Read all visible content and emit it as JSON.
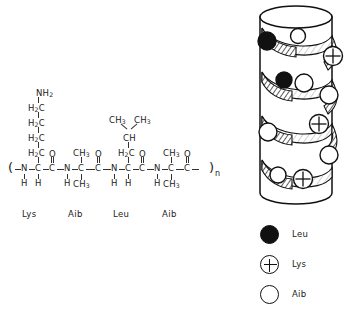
{
  "figure": {
    "title": "",
    "type": "chemical-structure-and-helix-model"
  },
  "structure": {
    "open_paren": "(",
    "close_paren": ")",
    "repeat_subscript": "n",
    "residues": [
      {
        "name": "Lys",
        "label": "Lys",
        "backbone": {
          "n": "N",
          "n_h": "H",
          "ca": "C",
          "ca_h": "H",
          "co": "C",
          "o": "O"
        },
        "sidechain_top_down": [
          "NH2",
          "H2C",
          "H2C",
          "H2C",
          "H2C"
        ]
      },
      {
        "name": "Aib",
        "label": "Aib",
        "backbone": {
          "n": "N",
          "n_h": "H",
          "ca": "C",
          "co": "C",
          "o": "O"
        },
        "sidechain_up": "CH3",
        "sidechain_down": "CH3"
      },
      {
        "name": "Leu",
        "label": "Leu",
        "backbone": {
          "n": "N",
          "n_h": "H",
          "ca": "C",
          "ca_h": "H",
          "co": "C",
          "o": "O"
        },
        "sidechain_top_down": [
          "CH3",
          "CH3",
          "CH",
          "H2C"
        ]
      },
      {
        "name": "Aib",
        "label": "Aib",
        "backbone": {
          "n": "N",
          "n_h": "H",
          "ca": "C",
          "co": "C",
          "o": "O"
        },
        "sidechain_up": "CH3",
        "sidechain_down": "CH3"
      }
    ],
    "atoms": {
      "N": "N",
      "C": "C",
      "O": "O",
      "H": "H",
      "CH3": "CH3",
      "H2C": "H2C",
      "CH": "CH",
      "NH2": "NH2"
    }
  },
  "legend": {
    "items": [
      {
        "label": "Leu",
        "marker": "filled-circle",
        "color": "#111111"
      },
      {
        "label": "Lys",
        "marker": "plus-circle",
        "color": "#ffffff"
      },
      {
        "label": "Aib",
        "marker": "open-circle",
        "color": "#ffffff"
      }
    ]
  },
  "helix": {
    "description": "alpha-helix cylinder model",
    "residue_markers": [
      {
        "type": "Leu",
        "turn": 1
      },
      {
        "type": "Aib",
        "turn": 1
      },
      {
        "type": "Lys",
        "turn": 1
      },
      {
        "type": "Leu",
        "turn": 2
      },
      {
        "type": "Aib",
        "turn": 2
      },
      {
        "type": "Aib",
        "turn": 2
      },
      {
        "type": "Aib",
        "turn": 3
      },
      {
        "type": "Lys",
        "turn": 3
      },
      {
        "type": "Aib",
        "turn": 3
      },
      {
        "type": "Aib",
        "turn": 4
      },
      {
        "type": "Lys",
        "turn": 4
      }
    ]
  }
}
